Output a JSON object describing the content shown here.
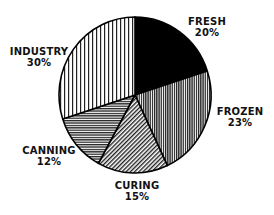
{
  "chart_data": {
    "type": "pie",
    "title": "",
    "start_angle_deg": 0,
    "direction": "clockwise",
    "categories": [
      "FRESH",
      "FROZEN",
      "CURING",
      "CANNING",
      "INDUSTRY"
    ],
    "values": [
      20,
      23,
      15,
      12,
      30
    ],
    "value_labels": [
      "20%",
      "23%",
      "15%",
      "12%",
      "30%"
    ],
    "fill_patterns": [
      "solid-black",
      "dense-vertical-lines",
      "diagonal-hatch",
      "horizontal-lines",
      "sparse-vertical-lines"
    ],
    "legend": "none",
    "labels_position": "outside"
  },
  "labels": {
    "fresh": {
      "name": "FRESH",
      "pct": "20%"
    },
    "frozen": {
      "name": "FROZEN",
      "pct": "23%"
    },
    "curing": {
      "name": "CURING",
      "pct": "15%"
    },
    "canning": {
      "name": "CANNING",
      "pct": "12%"
    },
    "industry": {
      "name": "INDUSTRY",
      "pct": "30%"
    }
  }
}
